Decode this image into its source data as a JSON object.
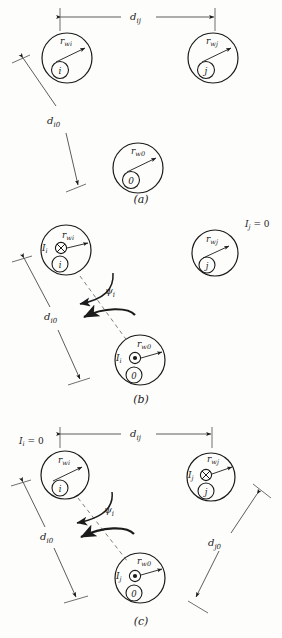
{
  "figure": {
    "background": "#fdfdfb",
    "ink": "#1b1b1b",
    "panels": [
      {
        "id": "a",
        "caption": "(a)",
        "labels": {
          "dij": "d",
          "dij_sub": "ij",
          "di0": "d",
          "di0_sub": "i0",
          "rwi": "r",
          "rwi_sub": "wi",
          "rwj": "r",
          "rwj_sub": "wj",
          "rw0": "r",
          "rw0_sub": "w0",
          "core_i": "i",
          "core_j": "j",
          "core_0": "0"
        }
      },
      {
        "id": "b",
        "caption": "(b)",
        "labels": {
          "di0": "d",
          "di0_sub": "i0",
          "rwi": "r",
          "rwi_sub": "wi",
          "rwj": "r",
          "rwj_sub": "wj",
          "rw0": "r",
          "rw0_sub": "w0",
          "core_i": "i",
          "core_j": "j",
          "core_0": "0",
          "psi": "ψ",
          "psi_sub": "i",
          "current_i_top": "I",
          "current_i_top_sub": "i",
          "current_i_bottom": "I",
          "current_i_bottom_sub": "i",
          "current_j_zero": "I",
          "current_j_zero_sub": "j",
          "current_j_zero_val": "= 0"
        },
        "symbols": {
          "top_circle": "current-into-page",
          "bottom_circle": "current-out-of-page"
        }
      },
      {
        "id": "c",
        "caption": "(c)",
        "labels": {
          "dij": "d",
          "dij_sub": "ij",
          "di0": "d",
          "di0_sub": "i0",
          "dj0": "d",
          "dj0_sub": "j0",
          "rwi": "r",
          "rwi_sub": "wi",
          "rwj": "r",
          "rwj_sub": "wj",
          "rw0": "r",
          "rw0_sub": "w0",
          "core_i": "i",
          "core_j": "j",
          "core_0": "0",
          "psi": "ψ",
          "psi_sub": "i",
          "current_i_zero": "I",
          "current_i_zero_sub": "i",
          "current_i_zero_val": "= 0",
          "current_j_right": "I",
          "current_j_right_sub": "j",
          "current_j_bottom": "I",
          "current_j_bottom_sub": "j"
        },
        "symbols": {
          "right_circle": "current-into-page",
          "bottom_circle": "current-out-of-page"
        }
      }
    ]
  }
}
